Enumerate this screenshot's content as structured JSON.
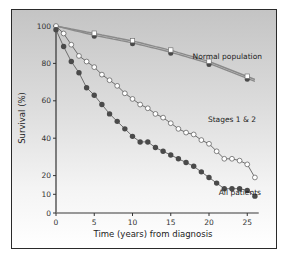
{
  "chart_data": {
    "type": "line",
    "title": "",
    "xlabel": "Time (years) from diagnosis",
    "ylabel": "Survival (%)",
    "xlim": [
      0,
      26
    ],
    "ylim": [
      0,
      100
    ],
    "x_ticks": [
      0,
      5,
      10,
      15,
      20,
      25
    ],
    "y_ticks": [
      0,
      10,
      20,
      40,
      60,
      80,
      100
    ],
    "grid": false,
    "legend_position": "inline labels",
    "series": [
      {
        "name": "Normal population",
        "marker": "gray line pair with open and filled markers",
        "x": [
          0,
          5,
          10,
          15,
          20,
          25
        ],
        "values": [
          100,
          95,
          91,
          86,
          80,
          72
        ],
        "values_upper": [
          100,
          96,
          92,
          87,
          81,
          73
        ]
      },
      {
        "name": "Stages 1 & 2",
        "marker": "open circle",
        "x": [
          0,
          1,
          2,
          3,
          4,
          5,
          6,
          7,
          8,
          9,
          10,
          11,
          12,
          13,
          14,
          15,
          16,
          17,
          18,
          19,
          20,
          21,
          22,
          23,
          24,
          25,
          26
        ],
        "values": [
          100,
          96,
          90,
          84,
          81,
          78,
          74,
          71,
          68,
          64,
          61,
          58,
          56,
          53,
          51,
          48,
          45,
          43,
          42,
          39,
          37,
          33,
          29,
          29,
          28,
          26,
          19
        ]
      },
      {
        "name": "All patients",
        "marker": "filled circle",
        "x": [
          0,
          1,
          2,
          3,
          4,
          5,
          6,
          7,
          8,
          9,
          10,
          11,
          12,
          13,
          14,
          15,
          16,
          17,
          18,
          19,
          20,
          21,
          22,
          23,
          24,
          25,
          26
        ],
        "values": [
          98,
          89,
          81,
          75,
          67,
          63,
          58,
          53,
          49,
          45,
          41,
          38,
          38,
          35,
          33,
          31,
          29,
          27,
          25,
          22,
          19,
          16,
          13,
          13,
          13,
          12,
          9
        ]
      }
    ],
    "annotations": [
      "Normal population",
      "Stages 1 & 2",
      "All patients"
    ]
  },
  "labels": {
    "xlabel": "Time (years) from diagnosis",
    "ylabel": "Survival (%)",
    "normal": "Normal population",
    "stages": "Stages 1 & 2",
    "all": "All patients"
  },
  "colors": {
    "line": "#6e6e6e",
    "normal_line": "#8a8a8a",
    "dot_fill": "#4a4a4a",
    "open_fill": "#ffffff",
    "axis": "#333333"
  }
}
